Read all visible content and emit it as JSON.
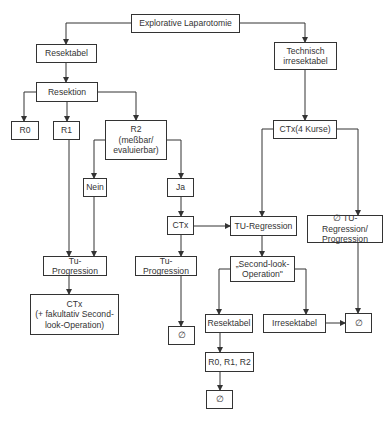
{
  "diagram": {
    "type": "flowchart",
    "nodes": {
      "explorative_laparotomie": "Explorative Laparotomie",
      "resektabel": "Resektabel",
      "technisch_irresektabel": "Technisch\nirresektabel",
      "resektion": "Resektion",
      "r0": "R0",
      "r1": "R1",
      "r2": "R2\n(meßbar/\nevaluierbar)",
      "ctx_4_kurse": "CTx(4 Kurse)",
      "nein": "Nein",
      "ja": "Ja",
      "ctx_mid": "CTx",
      "tu_regression": "TU-Regression",
      "no_tu_regression_progression": "∅ TU-Regression/\nProgression",
      "tu_progression_left": "Tu-Progression",
      "tu_progression_mid": "Tu-Progression",
      "second_look_operation": "„Second-look-\nOperation\"",
      "ctx_fakultativ": "CTx\n(+ fakultativ Second-\nlook-Operation)",
      "empty_mid": "∅",
      "resektabel_bottom": "Resektabel",
      "irresektabel": "Irresektabel",
      "empty_right": "∅",
      "r0_r1_r2": "R0, R1, R2",
      "empty_bottom": "∅"
    },
    "edges": [
      [
        "explorative_laparotomie",
        "resektabel"
      ],
      [
        "explorative_laparotomie",
        "technisch_irresektabel"
      ],
      [
        "resektabel",
        "resektion"
      ],
      [
        "resektion",
        "r0"
      ],
      [
        "resektion",
        "r1"
      ],
      [
        "resektion",
        "r2"
      ],
      [
        "r2",
        "nein"
      ],
      [
        "r2",
        "ja"
      ],
      [
        "r1",
        "tu_progression_left"
      ],
      [
        "nein",
        "tu_progression_left"
      ],
      [
        "tu_progression_left",
        "ctx_fakultativ"
      ],
      [
        "ja",
        "ctx_mid"
      ],
      [
        "ctx_mid",
        "tu_regression"
      ],
      [
        "ctx_mid",
        "tu_progression_mid"
      ],
      [
        "tu_progression_mid",
        "empty_mid"
      ],
      [
        "technisch_irresektabel",
        "ctx_4_kurse"
      ],
      [
        "ctx_4_kurse",
        "tu_regression"
      ],
      [
        "ctx_4_kurse",
        "no_tu_regression_progression"
      ],
      [
        "tu_regression",
        "second_look_operation"
      ],
      [
        "second_look_operation",
        "resektabel_bottom"
      ],
      [
        "second_look_operation",
        "irresektabel"
      ],
      [
        "irresektabel",
        "empty_right"
      ],
      [
        "no_tu_regression_progression",
        "empty_right"
      ],
      [
        "resektabel_bottom",
        "r0_r1_r2"
      ],
      [
        "r0_r1_r2",
        "empty_bottom"
      ]
    ]
  }
}
